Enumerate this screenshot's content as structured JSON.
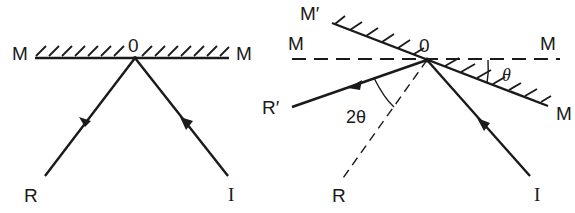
{
  "figure": {
    "left_panel": {
      "description": "Reflection at plane mirror",
      "labels": {
        "mirror_left": "M",
        "mirror_right": "M",
        "point": "0",
        "reflected": "R",
        "incident": "I"
      }
    },
    "right_panel": {
      "description": "Mirror rotated by angle theta deflects reflected ray by 2 theta",
      "labels": {
        "rotated_mirror_top": "M′",
        "original_mirror_left": "M",
        "original_mirror_right": "M",
        "rotated_mirror_bottom": "M",
        "point": "0",
        "new_reflected": "R′",
        "original_reflected": "R",
        "incident": "I",
        "deflection_angle": "2θ",
        "rotation_angle": "θ"
      }
    },
    "colors": {
      "ink": "#1a1a1a",
      "background": "#ffffff"
    }
  }
}
